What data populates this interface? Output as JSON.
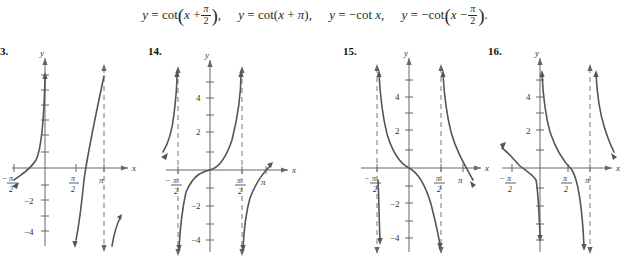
{
  "header": {
    "equations": [
      {
        "id": "eq1",
        "lhs": "y",
        "eq": "=",
        "fn": "cot",
        "open": "(",
        "arg_var": "x",
        "arg_op": "+",
        "frac_num": "π",
        "frac_den": "2",
        "close": ")",
        "trail": ",",
        "plain": "y = cot(x + π/2),"
      },
      {
        "id": "eq2",
        "lhs": "y",
        "eq": "=",
        "fn": "cot",
        "open": "(",
        "arg_var": "x",
        "arg_op": "+",
        "arg_const": "π",
        "close": ")",
        "trail": ",",
        "plain": "y = cot(x + π),"
      },
      {
        "id": "eq3",
        "lhs": "y",
        "eq": "=",
        "sign": "−",
        "fn": "cot",
        "arg_var": "x",
        "trail": ",",
        "plain": "y = −cot x,"
      },
      {
        "id": "eq4",
        "lhs": "y",
        "eq": "=",
        "sign": "−",
        "fn": "cot",
        "open": "(",
        "arg_var": "x",
        "arg_op": "−",
        "frac_num": "π",
        "frac_den": "2",
        "close": ")",
        "trail": ".",
        "plain": "y = −cot(x − π/2)."
      }
    ]
  },
  "panels": [
    {
      "number": "3.",
      "number_full": "13.",
      "axis_x_label": "x",
      "axis_y_label": "y",
      "x_ticks": [
        {
          "label_num": "π",
          "label_den": "2",
          "sign": "−",
          "text": "−π/2"
        },
        {
          "label_num": "π",
          "label_den": "2",
          "sign": "",
          "text": "π/2"
        },
        {
          "label_num": "π",
          "label_den": "",
          "sign": "",
          "text": "π"
        }
      ],
      "y_ticks": [
        "−2",
        "−4"
      ],
      "asymptotes": [
        "π"
      ],
      "curve_direction": "increasing"
    },
    {
      "number": "14.",
      "number_full": "14.",
      "axis_x_label": "x",
      "axis_y_label": "y",
      "x_ticks": [
        {
          "label_num": "π",
          "label_den": "2",
          "sign": "−",
          "text": "−π/2"
        },
        {
          "label_num": "π",
          "label_den": "2",
          "sign": "",
          "text": "π/2"
        },
        {
          "label_num": "π",
          "label_den": "",
          "sign": "",
          "text": "π"
        }
      ],
      "y_ticks": [
        "4",
        "2",
        "−2",
        "−4"
      ],
      "asymptotes": [
        "−π/2",
        "π/2"
      ],
      "curve_direction": "increasing"
    },
    {
      "number": "15.",
      "number_full": "15.",
      "axis_x_label": "x",
      "axis_y_label": "y",
      "x_ticks": [
        {
          "label_num": "π",
          "label_den": "2",
          "sign": "−",
          "text": "−π/2"
        },
        {
          "label_num": "π",
          "label_den": "2",
          "sign": "",
          "text": "π/2"
        },
        {
          "label_num": "π",
          "label_den": "",
          "sign": "",
          "text": "π"
        }
      ],
      "y_ticks": [
        "4",
        "2",
        "−2",
        "−4"
      ],
      "asymptotes": [
        "−π/2",
        "π/2"
      ],
      "curve_direction": "decreasing"
    },
    {
      "number": "16.",
      "number_full": "16.",
      "axis_x_label": "x",
      "axis_y_label": "y",
      "x_ticks": [
        {
          "label_num": "π",
          "label_den": "2",
          "sign": "−",
          "text": "−π/2"
        },
        {
          "label_num": "π",
          "label_den": "2",
          "sign": "",
          "text": "π/2"
        },
        {
          "label_num": "π",
          "label_den": "",
          "sign": "",
          "text": "π"
        }
      ],
      "y_ticks": [
        "4",
        "2"
      ],
      "asymptotes": [
        "π"
      ],
      "curve_direction": "decreasing"
    }
  ],
  "colors": {
    "ink": "#1a1a1a",
    "curve": "#555555",
    "axis": "#666666",
    "dash": "#777777",
    "background": "#ffffff"
  }
}
